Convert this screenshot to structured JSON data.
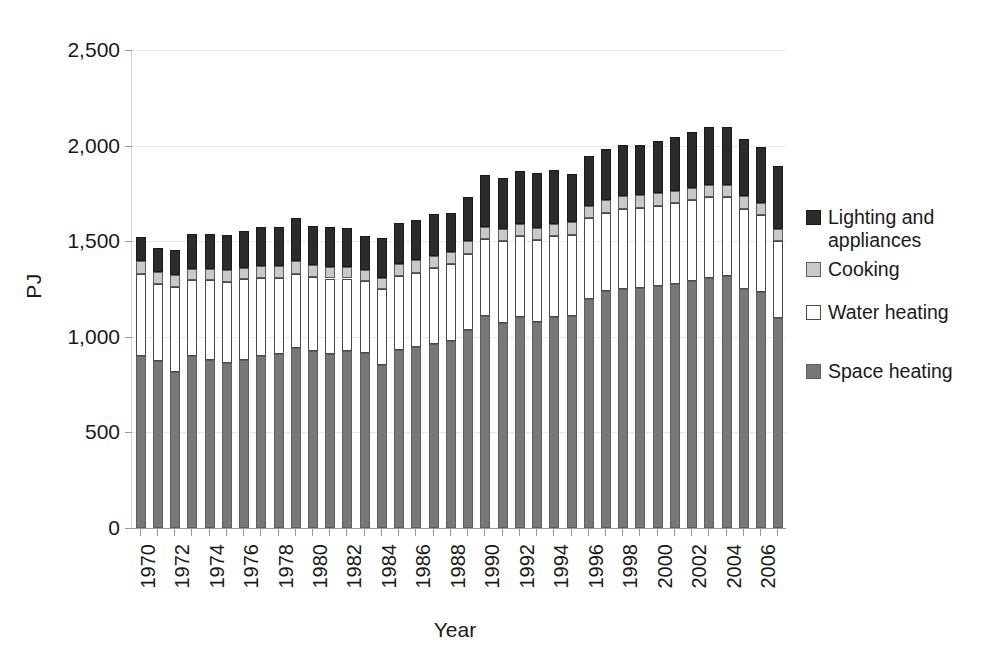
{
  "chart_data": {
    "type": "bar",
    "subtype": "stacked-vertical",
    "title": "",
    "xlabel": "Year",
    "ylabel": "PJ",
    "ylim": [
      0,
      2500
    ],
    "yticks": [
      "0",
      "500",
      "1,000",
      "1,500",
      "2,000",
      "2,500"
    ],
    "ytick_values": [
      0,
      500,
      1000,
      1500,
      2000,
      2500
    ],
    "grid": true,
    "legend_position": "right",
    "categories": [
      1970,
      1971,
      1972,
      1973,
      1974,
      1975,
      1976,
      1977,
      1978,
      1979,
      1980,
      1981,
      1982,
      1983,
      1984,
      1985,
      1986,
      1987,
      1988,
      1989,
      1990,
      1991,
      1992,
      1993,
      1994,
      1995,
      1996,
      1997,
      1998,
      1999,
      2000,
      2001,
      2002,
      2003,
      2004,
      2005,
      2006,
      2007
    ],
    "xtick_labels": [
      "1970",
      "1972",
      "1974",
      "1976",
      "1978",
      "1980",
      "1982",
      "1984",
      "1986",
      "1988",
      "1990",
      "1992",
      "1994",
      "1996",
      "1998",
      "2000",
      "2002",
      "2004",
      "2006"
    ],
    "xtick_every": 2,
    "series": [
      {
        "name": "Space heating",
        "color": "#787878",
        "values": [
          900,
          875,
          815,
          900,
          880,
          865,
          880,
          900,
          910,
          940,
          925,
          910,
          925,
          915,
          850,
          930,
          945,
          965,
          980,
          1035,
          1110,
          1070,
          1105,
          1075,
          1105,
          1110,
          1200,
          1240,
          1250,
          1255,
          1265,
          1275,
          1290,
          1310,
          1320,
          1250,
          1235,
          1100
        ]
      },
      {
        "name": "Water heating",
        "color": "#ffffff",
        "values": [
          430,
          400,
          445,
          395,
          415,
          420,
          420,
          410,
          400,
          390,
          390,
          395,
          380,
          375,
          400,
          390,
          390,
          395,
          400,
          400,
          400,
          430,
          420,
          430,
          420,
          425,
          420,
          410,
          420,
          420,
          420,
          425,
          425,
          420,
          410,
          420,
          400,
          400
        ]
      },
      {
        "name": "Cooking",
        "color": "#c9c9c9",
        "values": [
          65,
          62,
          62,
          62,
          62,
          62,
          62,
          62,
          62,
          65,
          62,
          62,
          62,
          62,
          60,
          62,
          65,
          65,
          65,
          65,
          65,
          65,
          65,
          65,
          65,
          65,
          65,
          65,
          65,
          65,
          65,
          65,
          65,
          65,
          65,
          65,
          65,
          65
        ]
      },
      {
        "name": "Lighting and appliances",
        "color": "#2b2b2b",
        "values": [
          125,
          125,
          130,
          180,
          180,
          185,
          190,
          200,
          205,
          225,
          200,
          205,
          200,
          175,
          205,
          215,
          210,
          215,
          200,
          230,
          270,
          265,
          275,
          285,
          285,
          250,
          260,
          265,
          270,
          265,
          275,
          280,
          290,
          300,
          300,
          300,
          295,
          330
        ]
      }
    ],
    "totals": [
      1520,
      1462,
      1452,
      1537,
      1537,
      1532,
      1552,
      1572,
      1577,
      1620,
      1577,
      1572,
      1567,
      1527,
      1515,
      1597,
      1610,
      1640,
      1645,
      1730,
      1845,
      1830,
      1865,
      1855,
      1875,
      1850,
      1945,
      1980,
      2005,
      2005,
      2025,
      2045,
      2070,
      2095,
      2095,
      2035,
      1995,
      1895
    ]
  },
  "legend": {
    "items": [
      {
        "label": "Lighting and\nappliances",
        "swatch": "light"
      },
      {
        "label": "Cooking",
        "swatch": "cooking"
      },
      {
        "label": "Water heating",
        "swatch": "water"
      },
      {
        "label": "Space heating",
        "swatch": "space"
      }
    ]
  },
  "colors": {
    "space_heating": "#787878",
    "water_heating": "#ffffff",
    "cooking": "#c9c9c9",
    "lighting_appliances": "#2b2b2b",
    "axis": "#9a9a9a",
    "grid": "#e9e9e9",
    "text": "#1a1a1a"
  }
}
